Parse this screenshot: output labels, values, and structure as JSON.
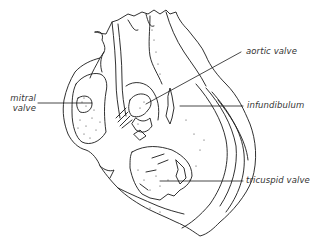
{
  "figure": {
    "colors": {
      "stroke": "#1a1a1a",
      "text": "#333333",
      "background": "#ffffff"
    }
  },
  "labels": {
    "aortic_valve": "aortic valve",
    "infundibulum": "infundibulum",
    "mitral_line1": "mitral",
    "mitral_line2": "valve",
    "tricuspid_valve": "tricuspid valve"
  }
}
